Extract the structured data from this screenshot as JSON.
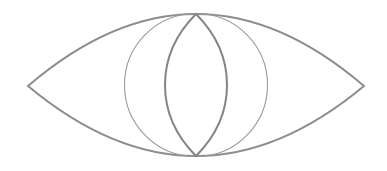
{
  "diagram": {
    "title": "",
    "canvas": {
      "width": 387,
      "height": 171,
      "background": "#ffffff"
    },
    "shapes": {
      "outer_lens": {
        "left_tip": [
          28,
          86
        ],
        "right_tip": [
          364,
          86
        ],
        "top": [
          196,
          14
        ],
        "bottom": [
          196,
          156
        ],
        "stroke": "#8c8c8c"
      },
      "circle": {
        "center": [
          196,
          85
        ],
        "radius": 71,
        "stroke": "#9a9a9a"
      },
      "inner_lens": {
        "top": [
          196,
          14
        ],
        "bottom": [
          196,
          156
        ],
        "left_x": 165,
        "right_x": 227,
        "stroke": "#858585"
      }
    }
  }
}
